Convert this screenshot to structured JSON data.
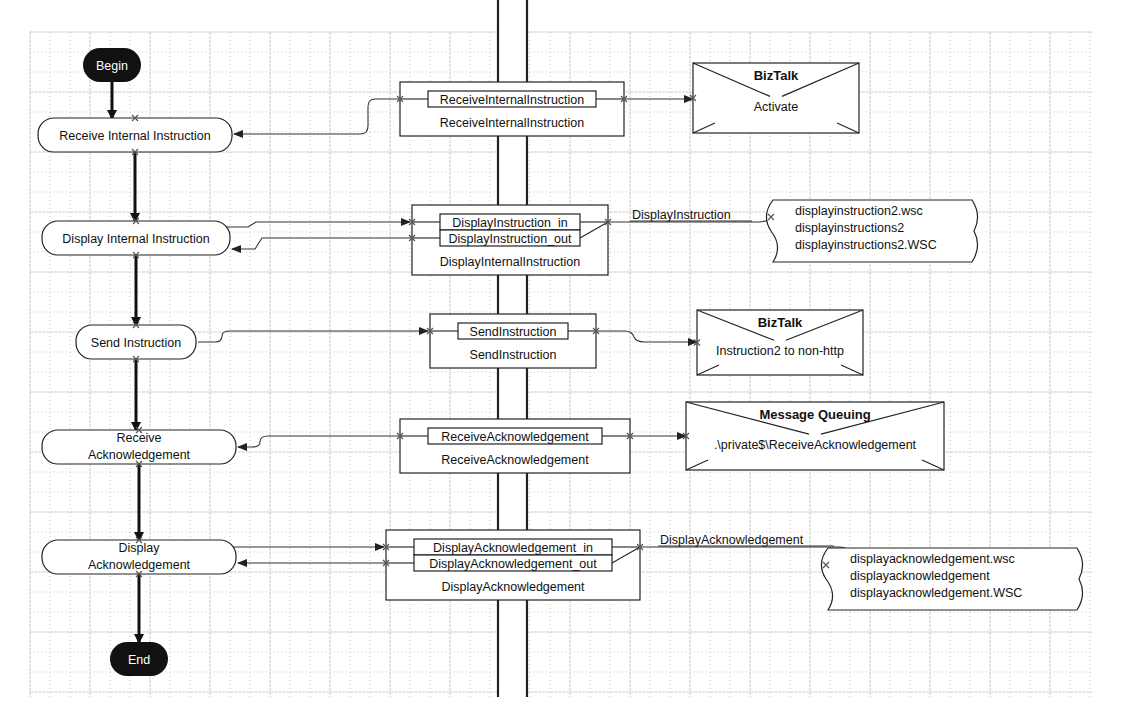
{
  "canvas": {
    "width": 1122,
    "height": 728,
    "grid": {
      "x0": 30,
      "y0": 32,
      "x1": 1092,
      "y1": 697,
      "minor": 20,
      "major_every": 3,
      "color": "#bdbdbd"
    }
  },
  "colors": {
    "terminal_fill": "#111111",
    "stroke": "#222222",
    "background": "#ffffff"
  },
  "divider": {
    "x_left": 498,
    "x_right": 527,
    "y_top": 0,
    "y_bottom": 697
  },
  "terminals": {
    "begin": {
      "label": "Begin",
      "cx": 112,
      "cy": 65,
      "w": 58,
      "h": 34
    },
    "end": {
      "label": "End",
      "cx": 139,
      "cy": 659,
      "w": 58,
      "h": 34
    }
  },
  "actions": [
    {
      "id": "receive-internal-instruction",
      "lines": [
        "Receive Internal Instruction"
      ],
      "x": 38,
      "y": 118,
      "w": 194,
      "h": 34
    },
    {
      "id": "display-internal-instruction",
      "lines": [
        "Display Internal Instruction"
      ],
      "x": 42,
      "y": 221,
      "w": 188,
      "h": 34
    },
    {
      "id": "send-instruction",
      "lines": [
        "Send Instruction"
      ],
      "x": 76,
      "y": 325,
      "w": 120,
      "h": 34
    },
    {
      "id": "receive-acknowledgement",
      "lines": [
        "Receive",
        "Acknowledgement"
      ],
      "x": 42,
      "y": 430,
      "w": 194,
      "h": 34
    },
    {
      "id": "display-acknowledgement",
      "lines": [
        "Display",
        "Acknowledgement"
      ],
      "x": 42,
      "y": 540,
      "w": 194,
      "h": 34
    }
  ],
  "ports": [
    {
      "id": "receive-internal-instruction-port",
      "x": 400,
      "y": 82,
      "w": 224,
      "h": 54,
      "title": "ReceiveInternalInstruction",
      "messages": [
        "ReceiveInternalInstruction"
      ]
    },
    {
      "id": "display-internal-instruction-port",
      "x": 412,
      "y": 205,
      "w": 196,
      "h": 70,
      "title": "DisplayInternalInstruction",
      "messages": [
        "DisplayInstruction_in",
        "DisplayInstruction_out"
      ]
    },
    {
      "id": "send-instruction-port",
      "x": 430,
      "y": 314,
      "w": 166,
      "h": 54,
      "title": "SendInstruction",
      "messages": [
        "SendInstruction"
      ]
    },
    {
      "id": "receive-acknowledgement-port",
      "x": 400,
      "y": 419,
      "w": 230,
      "h": 54,
      "title": "ReceiveAcknowledgement",
      "messages": [
        "ReceiveAcknowledgement"
      ]
    },
    {
      "id": "display-acknowledgement-port",
      "x": 386,
      "y": 530,
      "w": 254,
      "h": 70,
      "title": "DisplayAcknowledgement",
      "messages": [
        "DisplayAcknowledgement_in",
        "DisplayAcknowledgement_out"
      ]
    }
  ],
  "implementations": [
    {
      "id": "biztalk-activate",
      "type": "messaging",
      "x": 693,
      "y": 63,
      "w": 166,
      "h": 70,
      "title": "BizTalk",
      "subtitle": "Activate"
    },
    {
      "id": "biztalk-instruction2",
      "type": "messaging",
      "x": 697,
      "y": 310,
      "w": 166,
      "h": 65,
      "title": "BizTalk",
      "subtitle": "Instruction2 to non-http"
    },
    {
      "id": "msmq-receive-ack",
      "type": "messaging",
      "x": 686,
      "y": 402,
      "w": 258,
      "h": 68,
      "title": "Message Queuing",
      "subtitle": ".\\private$\\ReceiveAcknowledgement"
    },
    {
      "id": "script-display-instruction",
      "type": "script",
      "x": 765,
      "y": 200,
      "w": 215,
      "h": 62,
      "link_label": "DisplayInstruction",
      "lines": [
        "displayinstruction2.wsc",
        "displayinstructions2",
        "displayinstructions2.WSC"
      ]
    },
    {
      "id": "script-display-ack",
      "type": "script",
      "x": 820,
      "y": 548,
      "w": 265,
      "h": 62,
      "link_label": "DisplayAcknowledgement",
      "lines": [
        "displayacknowledgement.wsc",
        "displayacknowledgement",
        "displayacknowledgement.WSC"
      ]
    }
  ]
}
